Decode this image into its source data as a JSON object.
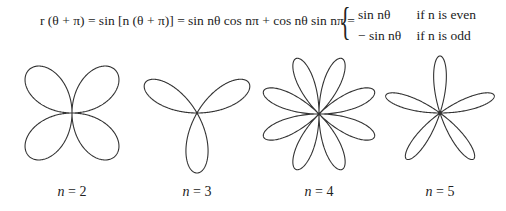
{
  "equation": {
    "lhs": "r (θ + π) = sin [n (θ + π)] = sin nθ cos nπ + cos nθ sin nπ =",
    "cases": [
      {
        "expr": "sin nθ",
        "condition": "if n is even"
      },
      {
        "expr": "− sin nθ",
        "condition": "if n is odd"
      }
    ]
  },
  "labels": [
    {
      "var": "n",
      "eq": " = ",
      "value": "2"
    },
    {
      "var": "n",
      "eq": " = ",
      "value": "3"
    },
    {
      "var": "n",
      "eq": " = ",
      "value": "4"
    },
    {
      "var": "n",
      "eq": " = ",
      "value": "5"
    }
  ],
  "chart_data": {
    "type": "polar-rose",
    "title": "",
    "function": "r = sin(nθ)",
    "stroke_color": "#333333",
    "series": [
      {
        "name": "n = 2",
        "n": 2,
        "petals": 4,
        "cx": 72,
        "cy": 65,
        "scale": 61,
        "rotation_deg": 0
      },
      {
        "name": "n = 3",
        "n": 3,
        "petals": 3,
        "cx": 197,
        "cy": 65,
        "scale": 60,
        "rotation_deg": 0
      },
      {
        "name": "n = 4",
        "n": 4,
        "petals": 8,
        "cx": 319,
        "cy": 66,
        "scale": 60,
        "rotation_deg": 0
      },
      {
        "name": "n = 5",
        "n": 5,
        "petals": 5,
        "cx": 440,
        "cy": 65,
        "scale": 57,
        "rotation_deg": 0
      }
    ]
  }
}
